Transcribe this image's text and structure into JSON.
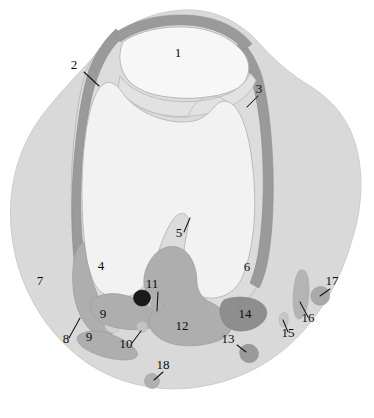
{
  "figure": {
    "type": "anatomical-cross-section",
    "width": 374,
    "height": 418,
    "background_color": "#ffffff"
  },
  "palette": {
    "page_background": "#ffffff",
    "soft_tissue_outer": "#d9d9d9",
    "soft_tissue_outer_edge": "#cfcfcf",
    "bone_interior": "#f2f2f2",
    "patella_interior": "#f7f7f7",
    "cartilage_band": "#dcdcdc",
    "retinaculum_dark": "#9a9a9a",
    "muscle_medium": "#aeaeae",
    "muscle_dark": "#949494",
    "vessel_black": "#1a1a1a",
    "vessel_gray": "#b0b0b0",
    "outline": "#9e9e9e",
    "label_color": "#0b0b0b"
  },
  "regions": [
    {
      "id": "patella",
      "number": "1",
      "fill": "#f7f7f7"
    },
    {
      "id": "medial-retinaculum",
      "number": "2",
      "fill": "#9a9a9a"
    },
    {
      "id": "lateral-retinaculum",
      "number": "3",
      "fill": "#9a9a9a"
    },
    {
      "id": "medial-femoral-condyle",
      "number": "4",
      "fill": "#f2f2f2"
    },
    {
      "id": "intercondylar-eminence",
      "number": "5",
      "fill": "#f2f2f2"
    },
    {
      "id": "lateral-femoral-condyle",
      "number": "6",
      "fill": "#f2f2f2"
    },
    {
      "id": "medial-muscle-mass",
      "number": "7",
      "fill": "#aeaeae"
    },
    {
      "id": "medial-notch",
      "number": "8",
      "fill": "#dcdcdc"
    },
    {
      "id": "posteromedial-muscle-upper",
      "number": "9",
      "fill": "#aeaeae"
    },
    {
      "id": "posteromedial-muscle-lower",
      "number": "9",
      "fill": "#aeaeae"
    },
    {
      "id": "small-vessel-medial",
      "number": "10",
      "fill": "#c3c3c3"
    },
    {
      "id": "popliteal-vessels",
      "number": "11",
      "fill": "#1a1a1a"
    },
    {
      "id": "central-posterior-mass",
      "number": "12",
      "fill": "#aeaeae"
    },
    {
      "id": "posterior-small-structure",
      "number": "13",
      "fill": "#9a9a9a"
    },
    {
      "id": "posterolateral-wedge",
      "number": "14",
      "fill": "#8e8e8e"
    },
    {
      "id": "lateral-small-vessel",
      "number": "15",
      "fill": "#c6c6c6"
    },
    {
      "id": "lateral-band",
      "number": "16",
      "fill": "#b4b4b4"
    },
    {
      "id": "lateral-nodule",
      "number": "17",
      "fill": "#a9a9a9"
    },
    {
      "id": "inferior-nodule",
      "number": "18",
      "fill": "#b0b0b0"
    }
  ],
  "labels": [
    {
      "key": "l1",
      "text": "1",
      "x": 178,
      "y": 57,
      "leader": false
    },
    {
      "key": "l2",
      "text": "2",
      "x": 74,
      "y": 69,
      "leader": true
    },
    {
      "key": "l3",
      "text": "3",
      "x": 259,
      "y": 93,
      "leader": true
    },
    {
      "key": "l4",
      "text": "4",
      "x": 101,
      "y": 270,
      "leader": false
    },
    {
      "key": "l5",
      "text": "5",
      "x": 179,
      "y": 237,
      "leader": true
    },
    {
      "key": "l6",
      "text": "6",
      "x": 247,
      "y": 271,
      "leader": false
    },
    {
      "key": "l7",
      "text": "7",
      "x": 40,
      "y": 285,
      "leader": false
    },
    {
      "key": "l8",
      "text": "8",
      "x": 66,
      "y": 343,
      "leader": true
    },
    {
      "key": "l9a",
      "text": "9",
      "x": 103,
      "y": 318,
      "leader": false
    },
    {
      "key": "l9b",
      "text": "9",
      "x": 89,
      "y": 341,
      "leader": false
    },
    {
      "key": "l10",
      "text": "10",
      "x": 126,
      "y": 348,
      "leader": true
    },
    {
      "key": "l11",
      "text": "11",
      "x": 152,
      "y": 288,
      "leader": true
    },
    {
      "key": "l12",
      "text": "12",
      "x": 182,
      "y": 330,
      "leader": false
    },
    {
      "key": "l13",
      "text": "13",
      "x": 228,
      "y": 343,
      "leader": true
    },
    {
      "key": "l14",
      "text": "14",
      "x": 245,
      "y": 318,
      "leader": false
    },
    {
      "key": "l15",
      "text": "15",
      "x": 288,
      "y": 337,
      "leader": true
    },
    {
      "key": "l16",
      "text": "16",
      "x": 308,
      "y": 322,
      "leader": true
    },
    {
      "key": "l17",
      "text": "17",
      "x": 332,
      "y": 285,
      "leader": true
    },
    {
      "key": "l18",
      "text": "18",
      "x": 163,
      "y": 369,
      "leader": true
    }
  ]
}
